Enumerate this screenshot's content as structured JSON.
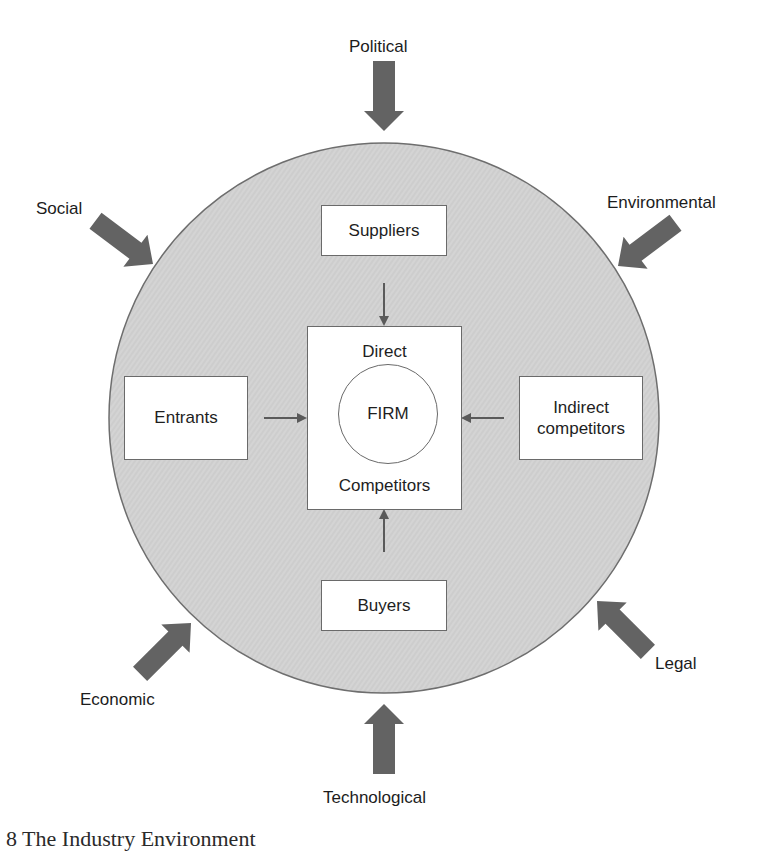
{
  "diagram": {
    "title": "The Industry Environment",
    "caption_fragment": "8  The Industry Environment",
    "colors": {
      "circle_fill": "#cfcfcf",
      "circle_stroke": "#6e6e6e",
      "force_arrow": "#636363",
      "inner_arrow": "#5a5a5a",
      "box_fill": "#ffffff",
      "box_stroke": "#6a6a6a"
    },
    "external_forces": [
      {
        "id": "political",
        "label": "Political",
        "direction": "down"
      },
      {
        "id": "environmental",
        "label": "Environmental",
        "direction": "down-left"
      },
      {
        "id": "legal",
        "label": "Legal",
        "direction": "up-left"
      },
      {
        "id": "technological",
        "label": "Technological",
        "direction": "up"
      },
      {
        "id": "economic",
        "label": "Economic",
        "direction": "up-right"
      },
      {
        "id": "social",
        "label": "Social",
        "direction": "down-right"
      }
    ],
    "industry_boxes": {
      "suppliers": "Suppliers",
      "buyers": "Buyers",
      "entrants": "Entrants",
      "indirect_line1": "Indirect",
      "indirect_line2": "competitors"
    },
    "core": {
      "top_label": "Direct",
      "center_label": "FIRM",
      "bottom_label": "Competitors"
    }
  }
}
